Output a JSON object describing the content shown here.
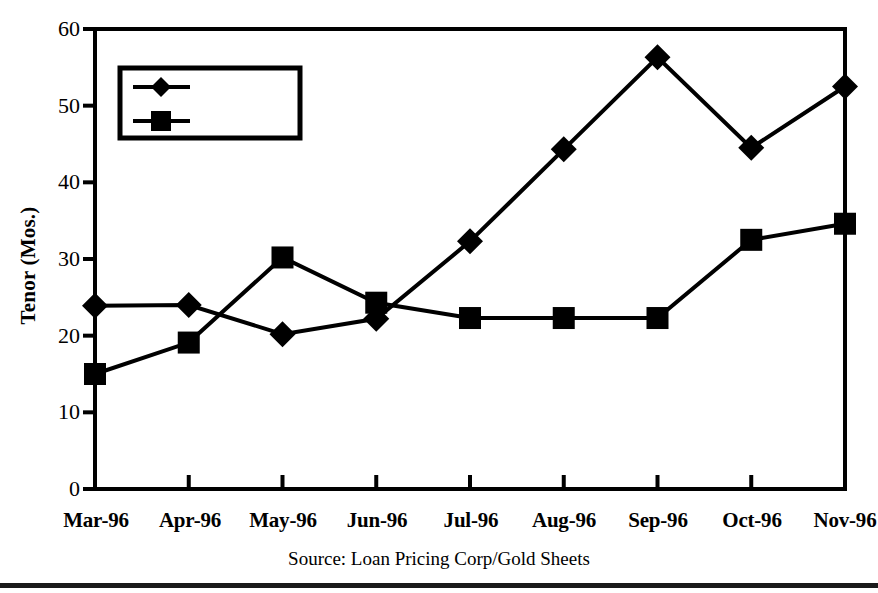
{
  "chart_data": {
    "type": "line",
    "title": "",
    "xlabel": "",
    "ylabel": "Tenor (Mos.)",
    "categories": [
      "Mar-96",
      "Apr-96",
      "May-96",
      "Jun-96",
      "Jul-96",
      "Aug-96",
      "Sep-96",
      "Oct-96",
      "Nov-96"
    ],
    "series": [
      {
        "name": "Argentina",
        "marker": "diamond",
        "values": [
          23.9,
          24.0,
          20.2,
          22.2,
          32.3,
          44.3,
          56.3,
          44.5,
          52.5
        ]
      },
      {
        "name": "Mexico",
        "marker": "square",
        "values": [
          15.0,
          19.1,
          30.2,
          24.3,
          22.3,
          22.3,
          22.3,
          32.5,
          34.6
        ]
      }
    ],
    "ylim": [
      0,
      60
    ],
    "yticks": [
      0,
      10,
      20,
      30,
      40,
      50,
      60
    ],
    "ytick_labels": [
      "0",
      "10",
      "20",
      "30",
      "40",
      "50",
      "60"
    ],
    "grid": false,
    "legend_position": "upper-left-inside",
    "line_color": "#000000",
    "background_color": "#ffffff"
  },
  "figure": {
    "source_note": "Source: Loan Pricing Corp/Gold Sheets"
  },
  "legend": {
    "entries": [
      {
        "label": "Argentina"
      },
      {
        "label": "Mexico"
      }
    ]
  }
}
